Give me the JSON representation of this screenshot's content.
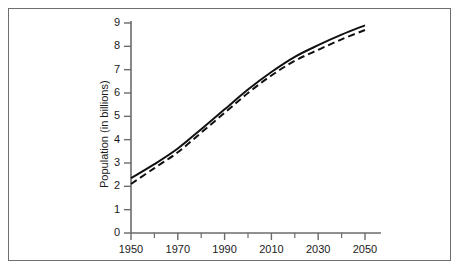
{
  "figure": {
    "border_color": "#6e6e6e",
    "background": "#ffffff"
  },
  "chart_data": {
    "type": "line",
    "title": "",
    "subtitle": "",
    "xlabel": "",
    "ylabel": "Population (in billions)",
    "xlim": [
      1950,
      2055
    ],
    "ylim": [
      0,
      9.3
    ],
    "grid": false,
    "legend_position": "none",
    "x_tick_labels": [
      "1950",
      "1970",
      "1990",
      "2010",
      "2030",
      "2050"
    ],
    "x_tick_values": [
      1950,
      1970,
      1990,
      2010,
      2030,
      2050
    ],
    "x_minor_tick_values": [
      1960,
      1980,
      2000,
      2020,
      2040
    ],
    "y_tick_labels": [
      "0",
      "1",
      "2",
      "3",
      "4",
      "5",
      "6",
      "7",
      "8",
      "9"
    ],
    "y_tick_values": [
      0,
      1,
      2,
      3,
      4,
      5,
      6,
      7,
      8,
      9
    ],
    "x": [
      1950,
      1960,
      1970,
      1980,
      1990,
      2000,
      2010,
      2020,
      2030,
      2040,
      2050
    ],
    "series": [
      {
        "name": "upper-projection",
        "style": "solid",
        "color": "#111111",
        "values": [
          2.35,
          2.95,
          3.62,
          4.45,
          5.3,
          6.15,
          6.9,
          7.55,
          8.05,
          8.5,
          8.9
        ]
      },
      {
        "name": "lower-projection",
        "style": "dashed",
        "color": "#111111",
        "values": [
          2.1,
          2.78,
          3.46,
          4.3,
          5.15,
          6.0,
          6.75,
          7.38,
          7.85,
          8.3,
          8.7
        ]
      }
    ],
    "annotations": []
  },
  "axis": {
    "y_title": "Population (in billions)"
  }
}
